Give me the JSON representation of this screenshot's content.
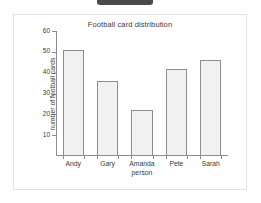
{
  "top_tab": {
    "label": ""
  },
  "chart_data": {
    "type": "bar",
    "title": "Football card distribution",
    "xlabel": "person",
    "ylabel": "number of football cards",
    "categories": [
      "Andy",
      "Gary",
      "Amanda",
      "Pete",
      "Sarah"
    ],
    "values": [
      51,
      36,
      22,
      42,
      46
    ],
    "ylim": [
      0,
      60
    ],
    "y_ticks": [
      10,
      20,
      30,
      40,
      50,
      60
    ],
    "grid": false,
    "legend": false,
    "colors": {
      "bar_fill": "#f1f1f1",
      "bar_border": "#8e8e8e",
      "axis": "#8c8c8c",
      "text": "#3a3a3a",
      "panel_border": "#e3e3e3",
      "tab": "#4a4a4a"
    }
  }
}
